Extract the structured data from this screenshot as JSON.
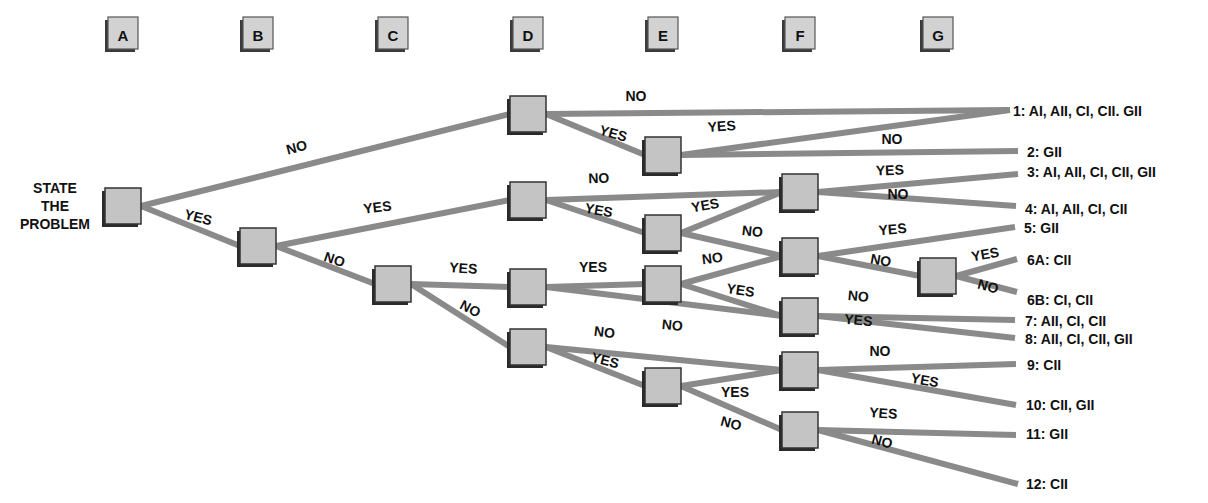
{
  "diagram": {
    "type": "decision-tree",
    "start_label": [
      "STATE",
      "THE",
      "PROBLEM"
    ],
    "columns": [
      {
        "id": "A",
        "label": "A",
        "x": 123
      },
      {
        "id": "B",
        "label": "B",
        "x": 258
      },
      {
        "id": "C",
        "label": "C",
        "x": 393
      },
      {
        "id": "D",
        "label": "D",
        "x": 528
      },
      {
        "id": "E",
        "label": "E",
        "x": 663
      },
      {
        "id": "F",
        "label": "F",
        "x": 800
      },
      {
        "id": "G",
        "label": "G",
        "x": 938
      }
    ],
    "nodes": [
      {
        "id": "A1",
        "column": "A",
        "x": 123,
        "y": 206
      },
      {
        "id": "B1",
        "column": "B",
        "x": 258,
        "y": 246
      },
      {
        "id": "C1",
        "column": "C",
        "x": 393,
        "y": 284
      },
      {
        "id": "D1",
        "column": "D",
        "x": 528,
        "y": 114
      },
      {
        "id": "D2",
        "column": "D",
        "x": 528,
        "y": 200
      },
      {
        "id": "D3",
        "column": "D",
        "x": 528,
        "y": 287
      },
      {
        "id": "D4",
        "column": "D",
        "x": 528,
        "y": 347
      },
      {
        "id": "E1",
        "column": "E",
        "x": 663,
        "y": 155
      },
      {
        "id": "E2",
        "column": "E",
        "x": 663,
        "y": 233
      },
      {
        "id": "E3",
        "column": "E",
        "x": 663,
        "y": 284
      },
      {
        "id": "E4",
        "column": "E",
        "x": 663,
        "y": 386
      },
      {
        "id": "F1",
        "column": "F",
        "x": 800,
        "y": 192
      },
      {
        "id": "F2",
        "column": "F",
        "x": 800,
        "y": 256
      },
      {
        "id": "F3",
        "column": "F",
        "x": 800,
        "y": 316
      },
      {
        "id": "F4",
        "column": "F",
        "x": 800,
        "y": 370
      },
      {
        "id": "F5",
        "column": "F",
        "x": 800,
        "y": 430
      },
      {
        "id": "G1",
        "column": "G",
        "x": 938,
        "y": 276
      }
    ],
    "edges": [
      {
        "from": "A1",
        "to": "D1",
        "label": "NO",
        "lx": 298,
        "ly": 152,
        "rot": -15
      },
      {
        "from": "A1",
        "to": "B1",
        "label": "YES",
        "lx": 197,
        "ly": 222,
        "rot": 14
      },
      {
        "from": "B1",
        "to": "D2",
        "label": "YES",
        "lx": 378,
        "ly": 212,
        "rot": -7
      },
      {
        "from": "B1",
        "to": "C1",
        "label": "NO",
        "lx": 333,
        "ly": 264,
        "rot": 18
      },
      {
        "from": "C1",
        "to": "D3",
        "label": "YES",
        "lx": 463,
        "ly": 273,
        "rot": 4
      },
      {
        "from": "C1",
        "to": "D4",
        "label": "NO",
        "lx": 468,
        "ly": 313,
        "rot": 28
      },
      {
        "from": "D1",
        "to": "OUT1",
        "label": "NO",
        "lx": 636,
        "ly": 101,
        "rot": 0
      },
      {
        "from": "D1",
        "to": "E1",
        "label": "YES",
        "lx": 612,
        "ly": 138,
        "rot": 16
      },
      {
        "from": "E1",
        "to": "OUT1",
        "label": "YES",
        "lx": 722,
        "ly": 131,
        "rot": -4
      },
      {
        "from": "E1",
        "to": "OUT2",
        "label": "NO",
        "lx": 892,
        "ly": 144,
        "rot": 0
      },
      {
        "from": "D2",
        "to": "F1",
        "label": "NO",
        "lx": 599,
        "ly": 183,
        "rot": -2
      },
      {
        "from": "D2",
        "to": "E2",
        "label": "YES",
        "lx": 598,
        "ly": 215,
        "rot": 10
      },
      {
        "from": "E2",
        "to": "F1",
        "label": "YES",
        "lx": 706,
        "ly": 210,
        "rot": -10
      },
      {
        "from": "E2",
        "to": "F2",
        "label": "NO",
        "lx": 752,
        "ly": 236,
        "rot": 6
      },
      {
        "from": "F1",
        "to": "OUT3",
        "label": "YES",
        "lx": 890,
        "ly": 175,
        "rot": -2
      },
      {
        "from": "F1",
        "to": "OUT4",
        "label": "NO",
        "lx": 898,
        "ly": 199,
        "rot": 0
      },
      {
        "from": "D3",
        "to": "E3",
        "label": "YES",
        "lx": 593,
        "ly": 272,
        "rot": 0
      },
      {
        "from": "D3",
        "to": "F3",
        "label": "NO",
        "lx": 672,
        "ly": 330,
        "rot": 5
      },
      {
        "from": "E3",
        "to": "F2",
        "label": "NO",
        "lx": 713,
        "ly": 263,
        "rot": -7
      },
      {
        "from": "E3",
        "to": "F3",
        "label": "YES",
        "lx": 740,
        "ly": 295,
        "rot": 8
      },
      {
        "from": "F2",
        "to": "OUT5",
        "label": "YES",
        "lx": 893,
        "ly": 234,
        "rot": -5
      },
      {
        "from": "F2",
        "to": "G1",
        "label": "NO",
        "lx": 880,
        "ly": 265,
        "rot": 10
      },
      {
        "from": "G1",
        "to": "OUT6A",
        "label": "YES",
        "lx": 986,
        "ly": 259,
        "rot": -10
      },
      {
        "from": "G1",
        "to": "OUT6B",
        "label": "NO",
        "lx": 987,
        "ly": 291,
        "rot": 15
      },
      {
        "from": "F3",
        "to": "OUT7",
        "label": "NO",
        "lx": 858,
        "ly": 301,
        "rot": 5
      },
      {
        "from": "F3",
        "to": "OUT8",
        "label": "YES",
        "lx": 858,
        "ly": 325,
        "rot": 5
      },
      {
        "from": "D4",
        "to": "F4",
        "label": "NO",
        "lx": 604,
        "ly": 337,
        "rot": 7
      },
      {
        "from": "D4",
        "to": "E4",
        "label": "YES",
        "lx": 604,
        "ly": 365,
        "rot": 14
      },
      {
        "from": "E4",
        "to": "F4",
        "label": "YES",
        "lx": 735,
        "ly": 397,
        "rot": 0
      },
      {
        "from": "E4",
        "to": "F5",
        "label": "NO",
        "lx": 730,
        "ly": 428,
        "rot": 15
      },
      {
        "from": "F4",
        "to": "OUT9",
        "label": "NO",
        "lx": 880,
        "ly": 356,
        "rot": 0
      },
      {
        "from": "F4",
        "to": "OUT10",
        "label": "YES",
        "lx": 924,
        "ly": 385,
        "rot": 10
      },
      {
        "from": "F5",
        "to": "OUT11",
        "label": "YES",
        "lx": 883,
        "ly": 418,
        "rot": 4
      },
      {
        "from": "F5",
        "to": "OUT12",
        "label": "NO",
        "lx": 881,
        "ly": 446,
        "rot": 15
      }
    ],
    "outcomes": [
      {
        "id": "OUT1",
        "label": "1: AI, AII, CI, CII. GII",
        "x": 1013,
        "y": 111,
        "ex": 1010,
        "ey": 110
      },
      {
        "id": "OUT2",
        "label": "2: GII",
        "x": 1027,
        "y": 152,
        "ex": 1018,
        "ey": 151
      },
      {
        "id": "OUT3",
        "label": "3: AI, AII, CI, CII, GII",
        "x": 1027,
        "y": 172,
        "ex": 1018,
        "ey": 174
      },
      {
        "id": "OUT4",
        "label": "4: AI, AII, CI, CII",
        "x": 1025,
        "y": 209,
        "ex": 1016,
        "ey": 206
      },
      {
        "id": "OUT5",
        "label": "5: GII",
        "x": 1024,
        "y": 228,
        "ex": 1015,
        "ey": 227
      },
      {
        "id": "OUT6A",
        "label": "6A: CII",
        "x": 1027,
        "y": 260,
        "ex": 1017,
        "ey": 259
      },
      {
        "id": "OUT6B",
        "label": "6B: CI, CII",
        "x": 1027,
        "y": 300,
        "ex": 1017,
        "ey": 292
      },
      {
        "id": "OUT7",
        "label": "7: AII, CI, CII",
        "x": 1025,
        "y": 321,
        "ex": 1015,
        "ey": 320
      },
      {
        "id": "OUT8",
        "label": "8: AII, CI, CII, GII",
        "x": 1025,
        "y": 339,
        "ex": 1015,
        "ey": 338
      },
      {
        "id": "OUT9",
        "label": "9: CII",
        "x": 1027,
        "y": 365,
        "ex": 1016,
        "ey": 364
      },
      {
        "id": "OUT10",
        "label": "10: CII, GII",
        "x": 1026,
        "y": 405,
        "ex": 1016,
        "ey": 405
      },
      {
        "id": "OUT11",
        "label": "11: GII",
        "x": 1026,
        "y": 434,
        "ex": 1016,
        "ey": 435
      },
      {
        "id": "OUT12",
        "label": "12: CII",
        "x": 1026,
        "y": 484,
        "ex": 1018,
        "ey": 484
      }
    ]
  }
}
